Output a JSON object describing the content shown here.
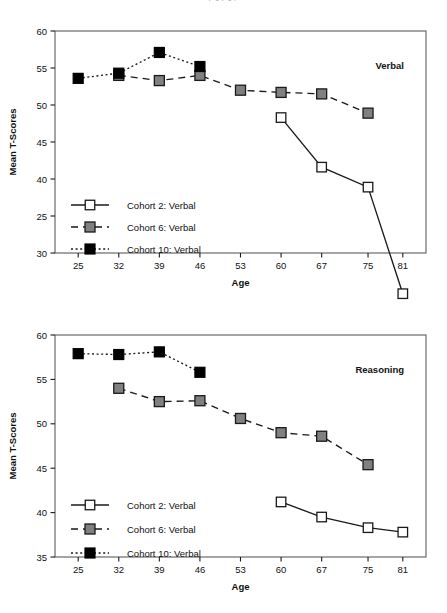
{
  "page": {
    "cut_top_text": "p g y g p"
  },
  "axis": {
    "xlabel": "Age",
    "ylabel": "Mean T-Scores",
    "x_ticks": [
      25,
      32,
      39,
      46,
      53,
      60,
      67,
      75,
      81
    ]
  },
  "legend": {
    "items": [
      {
        "label": "Cohort 2: Verbal",
        "fill": "#ffffff",
        "dash": "none",
        "key": "cohort-2"
      },
      {
        "label": "Cohort 6: Verbal",
        "fill": "#808080",
        "dash": "dashed",
        "key": "cohort-6"
      },
      {
        "label": "Cohort 10: Verbal",
        "fill": "#000000",
        "dash": "dotted",
        "key": "cohort-10"
      }
    ]
  },
  "colors": {
    "open_square": "#ffffff",
    "gray_square": "#808080",
    "black_square": "#000000",
    "stroke": "#1a1a1a",
    "frame": "#4d4d4d"
  },
  "chart_data": [
    {
      "type": "line",
      "title": "",
      "annotation": "Verbal",
      "xlabel": "Age",
      "ylabel": "Mean T-Scores",
      "x": [
        25,
        32,
        39,
        46,
        53,
        60,
        67,
        75,
        81
      ],
      "xlim": [
        21,
        85
      ],
      "ylim": [
        30,
        60
      ],
      "y_ticks": [
        30,
        25,
        40,
        45,
        50,
        55,
        60
      ],
      "y_tick_labels": [
        "30",
        "25",
        "40",
        "45",
        "50",
        "55",
        "60"
      ],
      "y_tick_values": [
        30,
        35,
        40,
        45,
        50,
        55,
        60
      ],
      "grid": false,
      "legend_position": "lower-left",
      "series": [
        {
          "name": "Cohort 2: Verbal",
          "marker": "open-square",
          "line": "solid",
          "x": [
            60,
            67,
            75,
            81
          ],
          "values": [
            48.3,
            41.6,
            38.9,
            24.5
          ]
        },
        {
          "name": "Cohort 6: Verbal",
          "marker": "gray-square",
          "line": "dashed",
          "x": [
            32,
            39,
            46,
            53,
            60,
            67,
            75
          ],
          "values": [
            54.0,
            53.3,
            54.0,
            52.0,
            51.7,
            51.5,
            48.9
          ]
        },
        {
          "name": "Cohort 10: Verbal",
          "marker": "black-square",
          "line": "dotted",
          "x": [
            25,
            32,
            39,
            46
          ],
          "values": [
            53.6,
            54.3,
            57.1,
            55.2
          ]
        }
      ]
    },
    {
      "type": "line",
      "title": "",
      "annotation": "Reasoning",
      "xlabel": "Age",
      "ylabel": "Mean T-Scores",
      "x": [
        25,
        32,
        39,
        46,
        53,
        60,
        67,
        75,
        81
      ],
      "xlim": [
        21,
        85
      ],
      "ylim": [
        35,
        60
      ],
      "y_ticks": [
        35,
        40,
        45,
        50,
        55,
        60
      ],
      "y_tick_labels": [
        "35",
        "40",
        "45",
        "50",
        "55",
        "60"
      ],
      "y_tick_values": [
        35,
        40,
        45,
        50,
        55,
        60
      ],
      "grid": false,
      "legend_position": "lower-left",
      "series": [
        {
          "name": "Cohort 2: Verbal",
          "marker": "open-square",
          "line": "solid",
          "x": [
            60,
            67,
            75,
            81
          ],
          "values": [
            41.2,
            39.5,
            38.3,
            37.8
          ]
        },
        {
          "name": "Cohort 6: Verbal",
          "marker": "gray-square",
          "line": "dashed",
          "x": [
            32,
            39,
            46,
            53,
            60,
            67,
            75
          ],
          "values": [
            54.0,
            52.5,
            52.6,
            50.6,
            49.0,
            48.6,
            45.4
          ]
        },
        {
          "name": "Cohort 10: Verbal",
          "marker": "black-square",
          "line": "dotted",
          "x": [
            25,
            32,
            39,
            46
          ],
          "values": [
            57.9,
            57.8,
            58.1,
            55.8
          ]
        }
      ]
    }
  ]
}
